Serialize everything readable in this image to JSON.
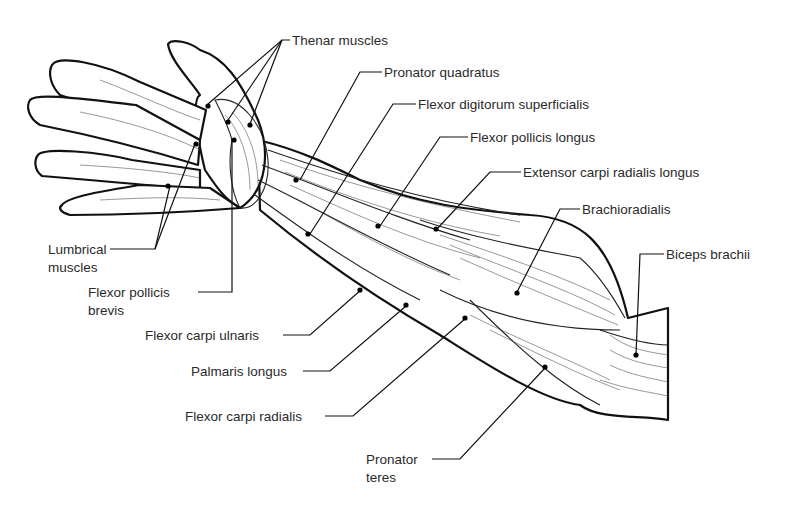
{
  "figure": {
    "labels": [
      {
        "id": "thenar-muscles",
        "text": "Thenar muscles",
        "x": 292,
        "y": 34
      },
      {
        "id": "pronator-quadratus",
        "text": "Pronator quadratus",
        "x": 384,
        "y": 66
      },
      {
        "id": "flexor-digitorum-superficialis",
        "text": "Flexor digitorum superficialis",
        "x": 418,
        "y": 98
      },
      {
        "id": "flexor-pollicis-longus",
        "text": "Flexor pollicis longus",
        "x": 470,
        "y": 131
      },
      {
        "id": "extensor-carpi-radialis-longus",
        "text": "Extensor carpi radialis longus",
        "x": 523,
        "y": 166
      },
      {
        "id": "brachioradialis",
        "text": "Brachioradialis",
        "x": 582,
        "y": 203
      },
      {
        "id": "biceps-brachii",
        "text": "Biceps brachii",
        "x": 666,
        "y": 248
      },
      {
        "id": "lumbrical-muscles",
        "text": "Lumbrical muscles",
        "x": 48,
        "y": 243
      },
      {
        "id": "flexor-pollicis-brevis",
        "text": "Flexor pollicis brevis",
        "x": 88,
        "y": 286
      },
      {
        "id": "flexor-carpi-ulnaris",
        "text": "Flexor carpi ulnaris",
        "x": 145,
        "y": 329
      },
      {
        "id": "palmaris-longus",
        "text": "Palmaris longus",
        "x": 191,
        "y": 365
      },
      {
        "id": "flexor-carpi-radialis",
        "text": "Flexor carpi radialis",
        "x": 185,
        "y": 410
      },
      {
        "id": "pronator-teres",
        "text": "Pronator teres",
        "x": 366,
        "y": 453
      }
    ]
  }
}
